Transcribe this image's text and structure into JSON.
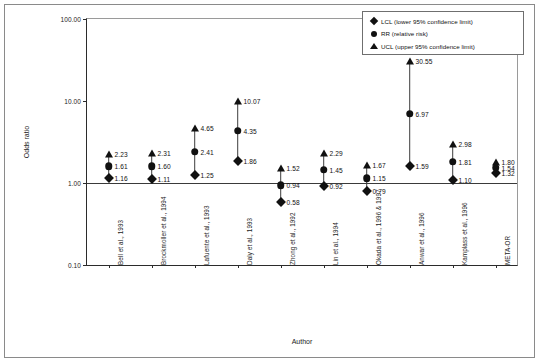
{
  "figure": {
    "xlabel": "Author",
    "ylabel": "Odds ratio"
  },
  "legend": {
    "items": [
      {
        "symbol": "diamond",
        "label": "LCL (lower 95% confidence limit)"
      },
      {
        "symbol": "circle",
        "label": "RR   (relative risk)"
      },
      {
        "symbol": "triangle",
        "label": "UCL (upper 95% confidence limit)"
      }
    ]
  },
  "axis": {
    "yticks": [
      "100.00",
      "10.00",
      "1.00",
      "0.10"
    ],
    "ytick_values": [
      100.0,
      10.0,
      1.0,
      0.1
    ],
    "reference_line": 1.0
  },
  "chart_data": {
    "type": "scatter",
    "title": "",
    "subtitle": "",
    "xlabel": "Author",
    "ylabel": "Odds ratio",
    "yscale": "log",
    "ylim": [
      0.1,
      100.0
    ],
    "ytick_labels": [
      "100.00",
      "10.00",
      "1.00",
      "0.10"
    ],
    "grid": false,
    "legend_position": "top-right",
    "reference_line_y": 1.0,
    "categories": [
      "Bell et al., 1993",
      "Brockmoller et al., 1994",
      "Lafuente et al., 1993",
      "Daly et al., 1993",
      "Zhong et al., 1992",
      "Lin et al., 1994",
      "Okada et al., 1996 & 1997",
      "Anwar et al., 1996",
      "Kamplass et al., 1996",
      "META-OR"
    ],
    "series": [
      {
        "name": "LCL (lower 95% confidence limit)",
        "symbol": "diamond",
        "values": [
          1.16,
          1.11,
          1.25,
          1.86,
          0.58,
          0.92,
          0.79,
          1.59,
          1.1,
          1.32
        ]
      },
      {
        "name": "RR   (relative risk)",
        "symbol": "circle",
        "values": [
          1.61,
          1.6,
          2.41,
          4.35,
          0.94,
          1.45,
          1.15,
          6.97,
          1.81,
          1.54
        ]
      },
      {
        "name": "UCL (upper 95% confidence limit)",
        "symbol": "triangle",
        "values": [
          2.23,
          2.31,
          4.65,
          10.07,
          1.52,
          2.29,
          1.67,
          30.55,
          2.98,
          1.8
        ]
      }
    ],
    "point_labels": [
      {
        "category": "Bell et al., 1993",
        "lcl": "1.16",
        "rr": "1.61",
        "ucl": "2.23"
      },
      {
        "category": "Brockmoller et al., 1994",
        "lcl": "1.11",
        "rr": "1.60",
        "ucl": "2.31"
      },
      {
        "category": "Lafuente et al., 1993",
        "lcl": "1.25",
        "rr": "2.41",
        "ucl": "4.65"
      },
      {
        "category": "Daly et al., 1993",
        "lcl": "1.86",
        "rr": "4.35",
        "ucl": "10.07"
      },
      {
        "category": "Zhong et al., 1992",
        "lcl": "0.58",
        "rr": "0.94",
        "ucl": "1.52"
      },
      {
        "category": "Lin et al., 1994",
        "lcl": "0.92",
        "rr": "1.45",
        "ucl": "2.29"
      },
      {
        "category": "Okada et al., 1996 & 1997",
        "lcl": "0.79",
        "rr": "1.15",
        "ucl": "1.67"
      },
      {
        "category": "Anwar et al., 1996",
        "lcl": "1.59",
        "rr": "6.97",
        "ucl": "30.55"
      },
      {
        "category": "Kamplass et al., 1996",
        "lcl": "1.10",
        "rr": "1.81",
        "ucl": "2.98"
      },
      {
        "category": "META-OR",
        "lcl": "1.32",
        "rr": "1.54",
        "ucl": "1.80"
      }
    ]
  },
  "colors": {
    "marker": "#111111",
    "axis": "#2b2b2b",
    "frame": "#8a8a8a",
    "background": "#ffffff"
  }
}
